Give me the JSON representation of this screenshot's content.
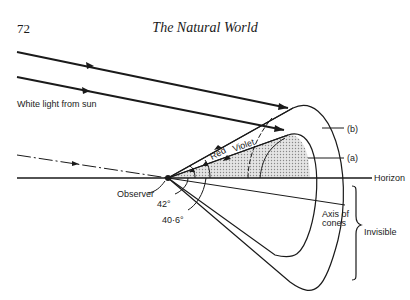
{
  "header": {
    "page_number": "72",
    "title": "The Natural World"
  },
  "diagram": {
    "labels": {
      "white_light": "White light from sun",
      "red": "Red",
      "violet": "Violet",
      "b": "(b)",
      "a": "(a)",
      "horizon": "Horizon",
      "observer": "Observer",
      "angle_42": "42°",
      "angle_40_6": "40·6°",
      "axis_of_cones_1": "Axis of",
      "axis_of_cones_2": "cones",
      "invisible": "Invisible"
    },
    "colors": {
      "ink": "#1a1a1a",
      "shading": "#cfcfcf"
    }
  }
}
